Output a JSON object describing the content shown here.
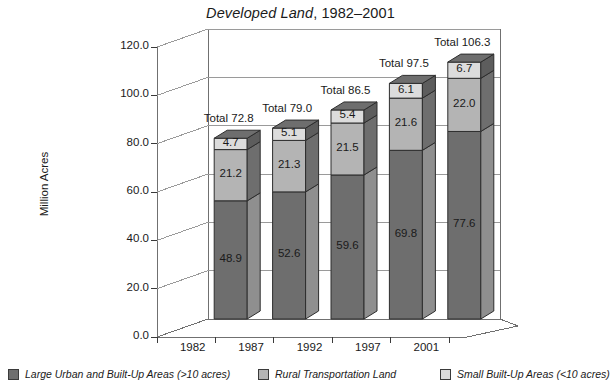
{
  "chart_data": {
    "type": "bar",
    "subtype": "stacked-3d-column",
    "title": "Developed Land, 1982–2001",
    "title_italic_part": "Developed Land",
    "title_roman_part": ", 1982–2001",
    "xlabel": "",
    "ylabel": "Million Acres",
    "categories": [
      "1982",
      "1987",
      "1992",
      "1997",
      "2001"
    ],
    "ylim": [
      0,
      120
    ],
    "ytick_step": 20,
    "ytick_labels": [
      "0.0",
      "20.0",
      "40.0",
      "60.0",
      "80.0",
      "100.0",
      "120.0"
    ],
    "ytick_values": [
      0,
      20,
      40,
      60,
      80,
      100,
      120
    ],
    "grid": true,
    "legend_position": "bottom",
    "series": [
      {
        "name": "Large Urban and Built-Up Areas (>10 acres)",
        "color": "#6e6e6e",
        "side_color": "#8f8f8f",
        "top_color": "#5a5a5a",
        "values": [
          48.9,
          52.6,
          59.6,
          69.8,
          77.6
        ],
        "labels": [
          "48.9",
          "52.6",
          "59.6",
          "69.8",
          "77.6"
        ]
      },
      {
        "name": "Rural Transportation Land",
        "color": "#b4b4b4",
        "side_color": "#6e6e6e",
        "top_color": "#9a9a9a",
        "values": [
          21.2,
          21.3,
          21.5,
          21.6,
          22.0
        ],
        "labels": [
          "21.2",
          "21.3",
          "21.5",
          "21.6",
          "22.0"
        ]
      },
      {
        "name": "Small Built-Up Areas (<10 acres)",
        "color": "#dcdcdc",
        "side_color": "#5d5d5d",
        "top_color": "#6e6e6e",
        "values": [
          4.7,
          5.1,
          5.4,
          6.1,
          6.7
        ],
        "labels": [
          "4.7",
          "5.1",
          "5.4",
          "6.1",
          "6.7"
        ]
      }
    ],
    "totals": [
      72.8,
      79.0,
      86.5,
      97.5,
      106.3
    ],
    "total_labels": [
      "Total 72.8",
      "Total 79.0",
      "Total 86.5",
      "Total 97.5",
      "Total 106.3"
    ],
    "annotations": {
      "total_prefix": "Total"
    }
  },
  "legend": {
    "items": [
      {
        "label": "Large Urban and Built-Up Areas (>10 acres)",
        "color": "#6e6e6e"
      },
      {
        "label": "Rural Transportation Land",
        "color": "#b4b4b4"
      },
      {
        "label": "Small Built-Up Areas (<10 acres)",
        "color": "#dcdcdc"
      }
    ]
  },
  "axis": {
    "y_title": "Million Acres"
  }
}
